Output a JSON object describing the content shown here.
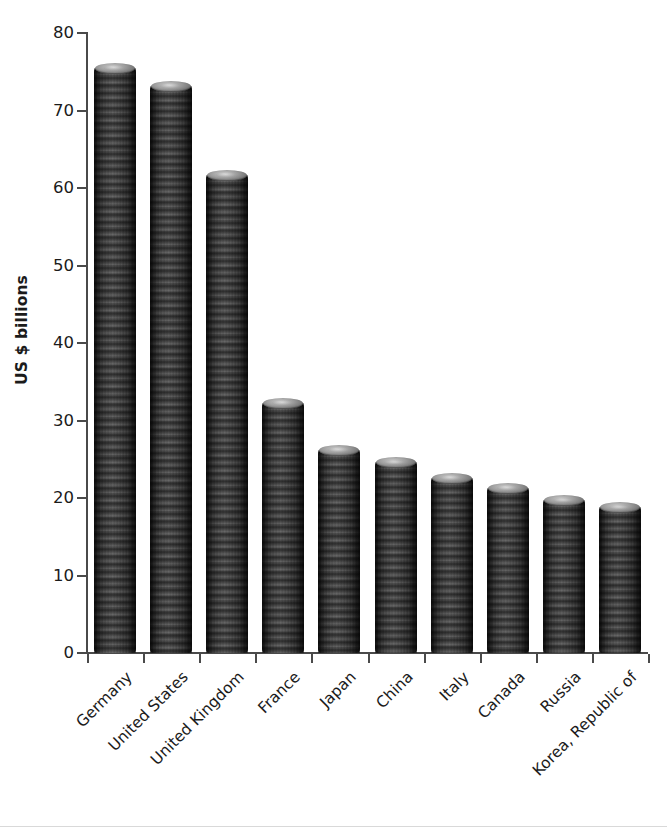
{
  "chart_data": {
    "type": "bar",
    "title": "",
    "subtitle": "",
    "xlabel": "",
    "ylabel": "US $ billions",
    "ylim": [
      0,
      80
    ],
    "ytick_values": [
      0,
      10,
      20,
      30,
      40,
      50,
      60,
      70,
      80
    ],
    "ytick_labels": [
      "0",
      "10",
      "20",
      "30",
      "40",
      "50",
      "60",
      "70",
      "80"
    ],
    "grid": false,
    "legend": null,
    "bar_style": "coin-stack-pictorial",
    "bar_color": "#6f6f6f",
    "axis_color": "#4a4a4a",
    "text_color": "#1b1b1b",
    "background_color": "#ffffff",
    "xtick_rotation": -45,
    "categories": [
      "Germany",
      "United States",
      "United Kingdom",
      "France",
      "Japan",
      "China",
      "Italy",
      "Canada",
      "Russia",
      "Korea, Republic of"
    ],
    "values": [
      75.5,
      73.2,
      61.7,
      32.3,
      26.2,
      24.6,
      22.6,
      21.3,
      19.7,
      18.8
    ],
    "series": [
      {
        "name": "US $ billions",
        "values": [
          75.5,
          73.2,
          61.7,
          32.3,
          26.2,
          24.6,
          22.6,
          21.3,
          19.7,
          18.8
        ]
      }
    ]
  },
  "axes": {
    "y_title": "US $ billions"
  }
}
